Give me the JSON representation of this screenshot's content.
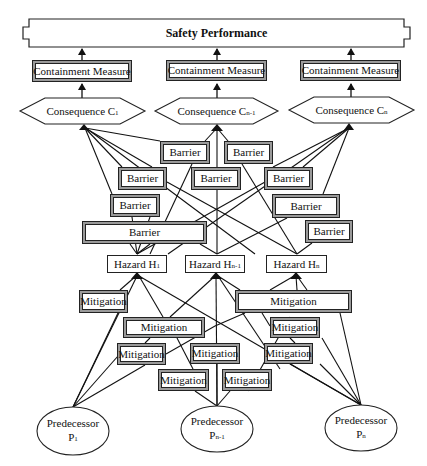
{
  "title": "Safety Performance",
  "containment": [
    {
      "label": "Containment Measure"
    },
    {
      "label": "Containment Measure"
    },
    {
      "label": "Containment Measure"
    }
  ],
  "consequences": [
    {
      "label": "Consequence C",
      "sub": "1"
    },
    {
      "label": "Consequence C",
      "sub": "n-1"
    },
    {
      "label": "Consequence C",
      "sub": "n"
    }
  ],
  "barriers": [
    {
      "label": "Barrier"
    },
    {
      "label": "Barrier"
    },
    {
      "label": "Barrier"
    },
    {
      "label": "Barrier"
    },
    {
      "label": "Barrier"
    },
    {
      "label": "Barrier"
    },
    {
      "label": "Barrier"
    },
    {
      "label": "Barrier"
    },
    {
      "label": "Barrier"
    }
  ],
  "hazards": [
    {
      "label": "Hazard H",
      "sub": "1"
    },
    {
      "label": "Hazard H",
      "sub": "n-1"
    },
    {
      "label": "Hazard H",
      "sub": "n"
    }
  ],
  "mitigations": [
    {
      "label": "Mitigation"
    },
    {
      "label": "Mitigation"
    },
    {
      "label": "Mitigation"
    },
    {
      "label": "Mitigation"
    },
    {
      "label": "Mitigation"
    },
    {
      "label": "Mitigation"
    },
    {
      "label": "Mitigation"
    },
    {
      "label": "Mitigation"
    },
    {
      "label": "Mitigation"
    }
  ],
  "predecessors": [
    {
      "label": "Predecessor",
      "line2": "P",
      "sub": "1"
    },
    {
      "label": "Predecessor",
      "line2": "P",
      "sub": "n-1"
    },
    {
      "label": "Predecessor",
      "line2": "P",
      "sub": "n"
    }
  ],
  "colors": {
    "stroke": "#1a1a1a",
    "frame_gray": "#9a9a9a",
    "fill": "#ffffff"
  }
}
